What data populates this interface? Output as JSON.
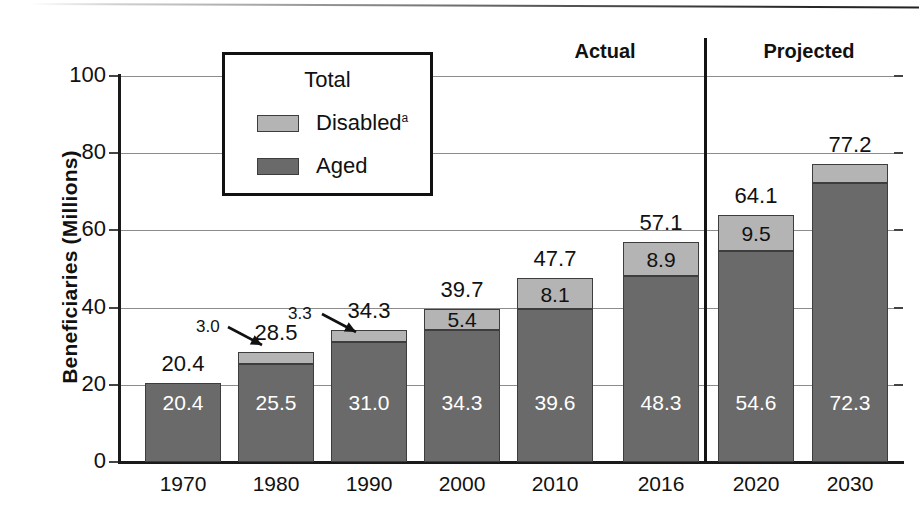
{
  "chart_data": {
    "type": "bar",
    "subtype": "stacked-bar",
    "title": "",
    "xlabel": "",
    "ylabel": "Beneficiaries (Millions)",
    "ylim": [
      0,
      100
    ],
    "yticks": [
      0,
      20,
      40,
      60,
      80,
      100
    ],
    "ytick_labels": [
      "0",
      "20",
      "40",
      "60",
      "80",
      "100"
    ],
    "grid": true,
    "legend_position": "top-left-inset",
    "categories": [
      "1970",
      "1980",
      "1990",
      "2000",
      "2010",
      "2016",
      "2020",
      "2030"
    ],
    "series": [
      {
        "name": "Aged",
        "color": "#6a6a6a",
        "values": [
          20.4,
          25.5,
          31.0,
          34.3,
          39.6,
          48.3,
          54.6,
          72.3
        ],
        "labels": [
          "20.4",
          "25.5",
          "31.0",
          "34.3",
          "39.6",
          "48.3",
          "54.6",
          "72.3"
        ]
      },
      {
        "name": "Disabled",
        "color": "#b4b4b4",
        "values": [
          0.0,
          3.0,
          3.3,
          5.4,
          8.1,
          8.9,
          9.5,
          8.9
        ],
        "labels": [
          "",
          "3.0",
          "3.3",
          "5.4",
          "8.1",
          "8.9",
          "9.5",
          "8.9"
        ]
      }
    ],
    "totals": [
      20.4,
      28.5,
      34.3,
      39.7,
      47.7,
      57.1,
      64.1,
      77.2
    ],
    "total_labels": [
      "20.4",
      "28.5",
      "34.3",
      "39.7",
      "47.7",
      "57.1",
      "64.1",
      "77.2"
    ],
    "callouts": [
      {
        "text": "3.0",
        "category": "1980"
      },
      {
        "text": "3.3",
        "category": "1990"
      }
    ],
    "annotations": [
      {
        "text": "Actual",
        "covers": [
          "1970",
          "1980",
          "1990",
          "2000",
          "2010",
          "2016"
        ]
      },
      {
        "text": "Projected",
        "covers": [
          "2020",
          "2030"
        ]
      }
    ],
    "legend": {
      "title": "Total",
      "entries": [
        {
          "label": "Disabled",
          "superscript": "a",
          "color": "#b4b4b4"
        },
        {
          "label": "Aged",
          "superscript": "",
          "color": "#6a6a6a"
        }
      ]
    }
  }
}
